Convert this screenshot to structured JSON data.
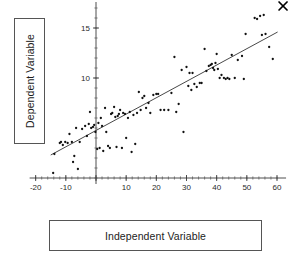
{
  "figure": {
    "ylabel_box": {
      "text": "Dependent Variable"
    },
    "xlabel_box": {
      "text": "Independent Variable"
    }
  },
  "chart_data": {
    "type": "scatter",
    "title": "",
    "xlabel": "Independent Variable",
    "ylabel": "Dependent Variable",
    "xlim": [
      -22,
      63
    ],
    "ylim": [
      -0.6,
      17.6
    ],
    "grid": false,
    "legend": null,
    "x_ticks": [
      -20,
      -10,
      0,
      10,
      20,
      30,
      40,
      50,
      60
    ],
    "x_tick_labels": [
      "-20",
      "-10",
      "",
      "10",
      "20",
      "30",
      "40",
      "50",
      "60"
    ],
    "x_minor_tick_step": 2,
    "y_ticks": [
      10,
      15
    ],
    "y_tick_labels": [
      "10",
      "15"
    ],
    "y_minor_tick_step": 1,
    "axis_origin": {
      "x": 0,
      "y": 0
    },
    "fit_line": {
      "label": "regression line",
      "x_start": -15.0,
      "y_start": 2.3,
      "x_end": 60.2,
      "y_end": 14.6,
      "slope": 0.1635,
      "intercept": 4.75
    },
    "annotations": [
      {
        "name": "outlier-x-marker",
        "symbol": "x",
        "x": 62.0,
        "y": 17.2
      }
    ],
    "points": [
      [
        -14.2,
        0.5
      ],
      [
        -13.8,
        2.4
      ],
      [
        -12.0,
        3.5
      ],
      [
        -11.6,
        3.6
      ],
      [
        -11.0,
        3.3
      ],
      [
        -10.2,
        3.6
      ],
      [
        -9.4,
        3.5
      ],
      [
        -8.8,
        4.4
      ],
      [
        -8.0,
        3.6
      ],
      [
        -7.6,
        1.6
      ],
      [
        -7.2,
        2.2
      ],
      [
        -6.6,
        5.0
      ],
      [
        -6.0,
        0.9
      ],
      [
        -5.4,
        3.6
      ],
      [
        -4.6,
        4.9
      ],
      [
        -3.6,
        5.2
      ],
      [
        -3.0,
        4.2
      ],
      [
        -2.4,
        5.4
      ],
      [
        -2.0,
        6.6
      ],
      [
        -1.6,
        5.0
      ],
      [
        -1.0,
        5.1
      ],
      [
        -0.6,
        5.3
      ],
      [
        -0.2,
        4.6
      ],
      [
        0.4,
        2.9
      ],
      [
        0.8,
        5.5
      ],
      [
        1.2,
        3.0
      ],
      [
        1.6,
        6.0
      ],
      [
        2.0,
        5.2
      ],
      [
        2.4,
        2.7
      ],
      [
        3.0,
        7.0
      ],
      [
        3.4,
        4.6
      ],
      [
        4.0,
        3.2
      ],
      [
        4.6,
        3.0
      ],
      [
        5.0,
        6.4
      ],
      [
        5.4,
        6.5
      ],
      [
        6.0,
        7.1
      ],
      [
        6.4,
        6.1
      ],
      [
        6.8,
        3.1
      ],
      [
        7.2,
        6.2
      ],
      [
        7.6,
        6.4
      ],
      [
        8.0,
        6.8
      ],
      [
        8.6,
        3.0
      ],
      [
        9.0,
        6.5
      ],
      [
        9.6,
        6.4
      ],
      [
        10.0,
        4.0
      ],
      [
        10.6,
        6.0
      ],
      [
        11.2,
        6.6
      ],
      [
        11.8,
        2.6
      ],
      [
        12.4,
        6.3
      ],
      [
        13.0,
        3.4
      ],
      [
        13.6,
        6.5
      ],
      [
        14.2,
        8.6
      ],
      [
        14.8,
        6.8
      ],
      [
        15.4,
        8.0
      ],
      [
        16.0,
        8.2
      ],
      [
        16.6,
        7.0
      ],
      [
        17.4,
        7.5
      ],
      [
        18.0,
        6.5
      ],
      [
        19.0,
        8.3
      ],
      [
        20.0,
        8.4
      ],
      [
        20.6,
        8.4
      ],
      [
        21.4,
        6.8
      ],
      [
        22.6,
        6.8
      ],
      [
        24.0,
        6.8
      ],
      [
        25.0,
        8.5
      ],
      [
        26.0,
        12.1
      ],
      [
        26.6,
        6.6
      ],
      [
        27.4,
        7.4
      ],
      [
        28.4,
        10.8
      ],
      [
        29.0,
        4.6
      ],
      [
        30.0,
        11.1
      ],
      [
        30.6,
        9.2
      ],
      [
        31.0,
        10.5
      ],
      [
        31.6,
        8.8
      ],
      [
        32.0,
        10.5
      ],
      [
        32.6,
        9.4
      ],
      [
        33.4,
        9.1
      ],
      [
        34.4,
        9.5
      ],
      [
        35.0,
        9.5
      ],
      [
        36.0,
        12.9
      ],
      [
        36.6,
        10.7
      ],
      [
        37.4,
        11.2
      ],
      [
        38.0,
        11.3
      ],
      [
        38.4,
        11.4
      ],
      [
        38.8,
        11.0
      ],
      [
        39.2,
        10.8
      ],
      [
        39.6,
        11.5
      ],
      [
        40.0,
        12.4
      ],
      [
        40.4,
        10.9
      ],
      [
        41.0,
        10.0
      ],
      [
        41.6,
        10.3
      ],
      [
        42.4,
        10.0
      ],
      [
        43.0,
        9.9
      ],
      [
        43.6,
        10.0
      ],
      [
        44.2,
        9.9
      ],
      [
        45.0,
        12.3
      ],
      [
        46.0,
        10.0
      ],
      [
        47.0,
        11.8
      ],
      [
        48.4,
        12.2
      ],
      [
        49.0,
        9.9
      ],
      [
        49.6,
        14.4
      ],
      [
        52.6,
        16.0
      ],
      [
        53.4,
        15.9
      ],
      [
        54.4,
        16.2
      ],
      [
        55.0,
        14.3
      ],
      [
        55.6,
        16.3
      ],
      [
        56.2,
        14.4
      ],
      [
        57.4,
        13.1
      ],
      [
        58.6,
        11.9
      ]
    ]
  }
}
